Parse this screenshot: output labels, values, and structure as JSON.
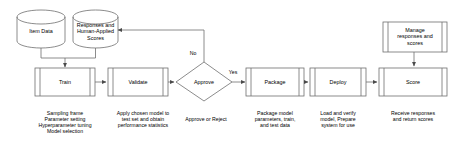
{
  "diagram": {
    "stroke_color": "#6e6e6e",
    "text_color": "#000000",
    "background": "#ffffff",
    "datastores": [
      {
        "id": "item-data",
        "label": "Item Data",
        "shape": "cylinder"
      },
      {
        "id": "responses-scores",
        "label": "Responses and\nHuman-Applied\nScores",
        "line1": "Responses and",
        "line2": "Human-Applied",
        "line3": "Scores",
        "shape": "cylinder"
      }
    ],
    "steps": [
      {
        "id": "train",
        "label": "Train",
        "shape": "predefined-process",
        "caption_lines": [
          "Sampling frame",
          "Parameter setting",
          "Hyperparameter tuning",
          "Model selection"
        ]
      },
      {
        "id": "validate",
        "label": "Validate",
        "shape": "predefined-process",
        "caption_lines": [
          "Apply chosen model to",
          "test set and obtain",
          "performance statistics"
        ]
      },
      {
        "id": "approve",
        "label": "Approve",
        "shape": "decision",
        "caption_lines": [
          "Approve or Reject"
        ]
      },
      {
        "id": "package",
        "label": "Package",
        "shape": "predefined-process",
        "caption_lines": [
          "Package model",
          "parameters, train,",
          "and test data"
        ]
      },
      {
        "id": "deploy",
        "label": "Deploy",
        "shape": "predefined-process",
        "caption_lines": [
          "Load and verify",
          "model, Prepare",
          "system for use"
        ]
      },
      {
        "id": "score",
        "label": "Score",
        "shape": "predefined-process",
        "caption_lines": [
          "Receive responses",
          "and return scores"
        ]
      }
    ],
    "manage_box": {
      "id": "manage",
      "shape": "predefined-process",
      "line1": "Manage",
      "line2": "responses and",
      "line3": "scores"
    },
    "edge_labels": {
      "no": "No",
      "yes": "Yes"
    }
  }
}
